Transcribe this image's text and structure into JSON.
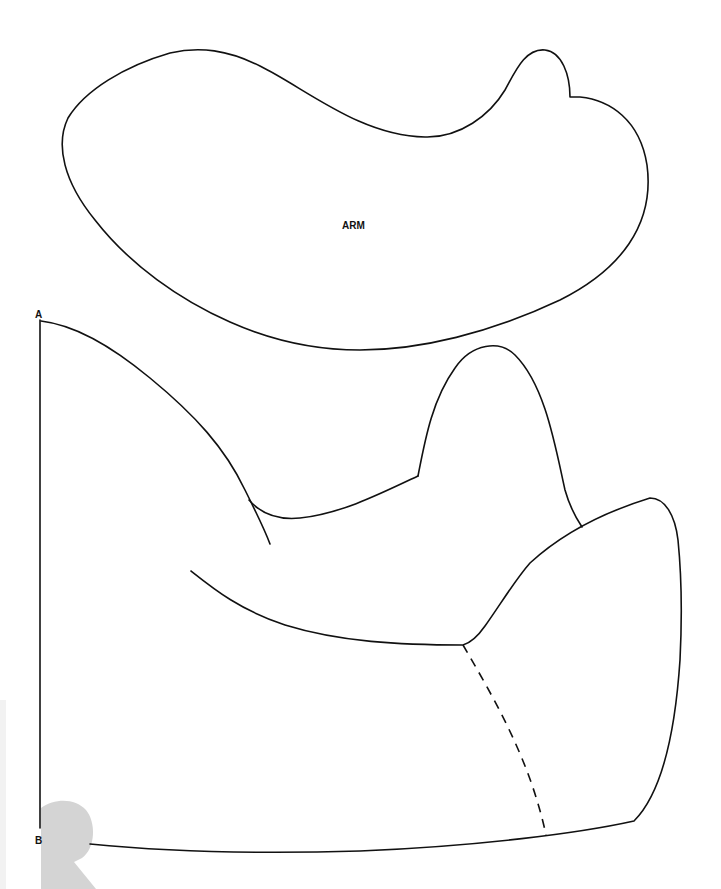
{
  "pattern": {
    "pieces": [
      {
        "id": "arm",
        "label": "ARM"
      },
      {
        "id": "body",
        "label": ""
      }
    ],
    "markers": {
      "top": "A",
      "bottom": "B"
    }
  },
  "colors": {
    "line": "#111111",
    "background": "#ffffff",
    "watermark": "#d4d4d4"
  }
}
